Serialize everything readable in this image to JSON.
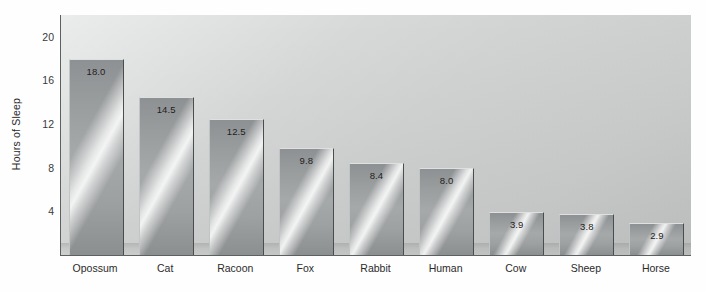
{
  "chart_data": {
    "type": "bar",
    "title": "",
    "xlabel": "",
    "ylabel": "Hours of Sleep",
    "categories": [
      "Opossum",
      "Cat",
      "Racoon",
      "Fox",
      "Rabbit",
      "Human",
      "Cow",
      "Sheep",
      "Horse"
    ],
    "values": [
      18.0,
      14.5,
      12.5,
      9.8,
      8.4,
      8.0,
      3.9,
      3.8,
      2.9
    ],
    "value_labels": [
      "18.0",
      "14.5",
      "12.5",
      "9.8",
      "8.4",
      "8.0",
      "3.9",
      "3.8",
      "2.9"
    ],
    "ylim": [
      0,
      22
    ],
    "yticks": [
      4,
      8,
      12,
      16,
      20
    ],
    "ytick_labels": [
      "4",
      "8",
      "12",
      "16",
      "20"
    ],
    "grid": false,
    "legend": null,
    "bar_style": "metallic-gradient-3d",
    "colors": {
      "plot_background": "#cdcfcf",
      "bar_base": "#9a9d9e",
      "bar_highlight": "#ffffff",
      "bar_edge": "#4a4d4e",
      "axis": "#5d6061",
      "text": "#2b2b2b",
      "page_background": "#fefefe"
    }
  },
  "axis": {
    "y_title": "Hours of Sleep"
  }
}
